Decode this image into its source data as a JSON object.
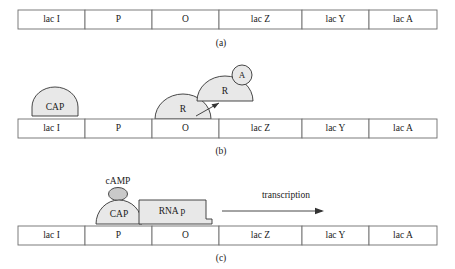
{
  "figure": {
    "background_color": "#ffffff",
    "outline_color": "#6e6e6e",
    "shape_fill_color": "#e8e8e8",
    "shape_fill_dark_color": "#c9c9c9",
    "ink_color": "#1a1a1a"
  },
  "operon": {
    "cells": [
      {
        "label": "lac I"
      },
      {
        "label": "P"
      },
      {
        "label": "O"
      },
      {
        "label": "lac Z"
      },
      {
        "label": "lac Y"
      },
      {
        "label": "lac A"
      }
    ]
  },
  "panels": [
    {
      "id": "a",
      "caption": "(a)",
      "shapes": []
    },
    {
      "id": "b",
      "caption": "(b)",
      "shapes": [
        {
          "name": "cap-protein",
          "label": "CAP"
        },
        {
          "name": "repressor-bound",
          "label": "R"
        },
        {
          "name": "repressor-free",
          "label": "R"
        },
        {
          "name": "allolactose",
          "label": "A"
        }
      ]
    },
    {
      "id": "c",
      "caption": "(c)",
      "shapes": [
        {
          "name": "camp-molecule",
          "label": "cAMP"
        },
        {
          "name": "cap-protein",
          "label": "CAP"
        },
        {
          "name": "rna-polymerase",
          "label": "RNA p"
        },
        {
          "name": "transcription-arrow",
          "label": "transcription"
        }
      ]
    }
  ],
  "labels": {
    "lac_i": "lac I",
    "promoter": "P",
    "operator": "O",
    "lac_z": "lac Z",
    "lac_y": "lac Y",
    "lac_a": "lac A",
    "cap": "CAP",
    "repressor": "R",
    "allolactose": "A",
    "camp": "cAMP",
    "rna_polymerase": "RNA p",
    "transcription": "transcription",
    "panel_a": "(a)",
    "panel_b": "(b)",
    "panel_c": "(c)"
  }
}
